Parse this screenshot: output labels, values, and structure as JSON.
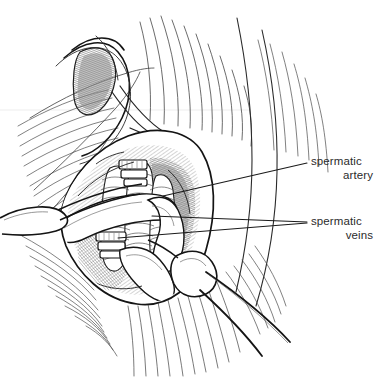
{
  "figure": {
    "type": "medical-line-illustration",
    "background_color": "#ffffff",
    "ink_color": "#1a1a1a",
    "shade_color": "#8c8c8c",
    "width": 378,
    "height": 384
  },
  "labels": [
    {
      "id": "spermatic-artery",
      "line1": "spermatic",
      "line2": "artery",
      "x": 311,
      "y": 155,
      "leader_count": 1
    },
    {
      "id": "spermatic-veins",
      "line1": "spermatic",
      "line2": "veins",
      "x": 311,
      "y": 215,
      "leader_count": 2
    }
  ],
  "leaders": [
    {
      "id": "leader-artery",
      "from_x": 163,
      "from_y": 196,
      "to_x": 307,
      "to_y": 163
    },
    {
      "id": "leader-vein-upper",
      "from_x": 152,
      "from_y": 216,
      "to_x": 307,
      "to_y": 222
    },
    {
      "id": "leader-vein-lower",
      "from_x": 118,
      "from_y": 238,
      "to_x": 307,
      "to_y": 223
    }
  ],
  "structures": {
    "wound_edge": "open elliptical incision with everted skin edges",
    "retractor_left": "blunt retractor blade entering from left margin",
    "forceps_lower_right": "two-handled clamp entering from lower right",
    "vessel_loops": "pale vessel loops encircling cord vessels",
    "ligature_clips": "banded ligature clips on cord structures",
    "fascia_fibers": "fanned aponeurotic fibers above and below the wound"
  }
}
